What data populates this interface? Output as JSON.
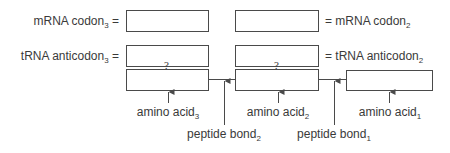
{
  "labels": {
    "mrna_codon3": {
      "text": "mRNA codon",
      "sub": "3",
      "suffix": " ="
    },
    "trna_anticodon3": {
      "text": "tRNA anticodon",
      "sub": "3",
      "suffix": " ="
    },
    "mrna_codon2": {
      "prefix": "= ",
      "text": "mRNA codon",
      "sub": "2"
    },
    "trna_anticodon2": {
      "prefix": "= ",
      "text": "tRNA anticodon",
      "sub": "2"
    },
    "amino_acid3": {
      "text": "amino acid",
      "sub": "3"
    },
    "amino_acid2": {
      "text": "amino acid",
      "sub": "2"
    },
    "amino_acid1": {
      "text": "amino acid",
      "sub": "1"
    },
    "peptide_bond2": {
      "text": "peptide bond",
      "sub": "2"
    },
    "peptide_bond1": {
      "text": "peptide bond",
      "sub": "1"
    }
  },
  "question_mark": "?"
}
